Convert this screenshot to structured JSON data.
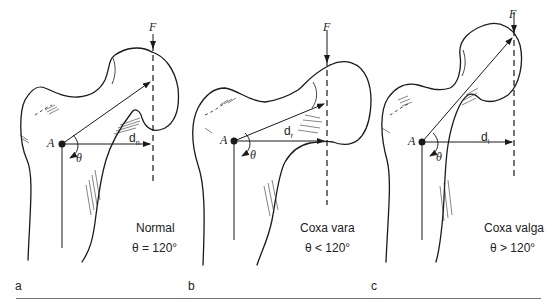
{
  "panels": [
    {
      "id": "a",
      "panel_label": "a",
      "force_label": "F",
      "pivot_label": "A",
      "angle_label": "θ",
      "moment_arm": {
        "base": "d",
        "subscript": "n"
      },
      "title": "Normal",
      "angle_text": "θ = 120°"
    },
    {
      "id": "b",
      "panel_label": "b",
      "force_label": "F",
      "pivot_label": "A",
      "angle_label": "θ",
      "moment_arm": {
        "base": "d",
        "subscript": "r"
      },
      "title": "Coxa vara",
      "angle_text": "θ < 120°"
    },
    {
      "id": "c",
      "panel_label": "c",
      "force_label": "F",
      "pivot_label": "A",
      "angle_label": "θ",
      "moment_arm": {
        "base": "d",
        "subscript": "i"
      },
      "title": "Coxa valga",
      "angle_text": "θ > 120°"
    }
  ]
}
